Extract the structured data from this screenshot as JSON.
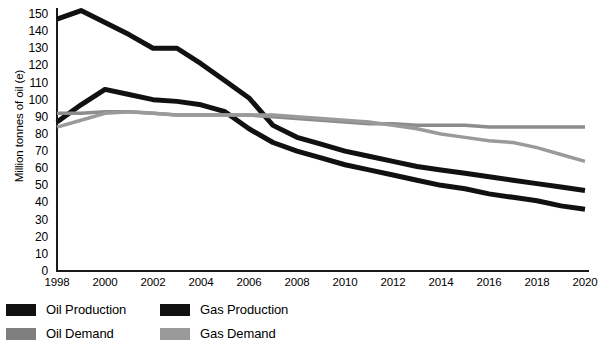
{
  "chart_data": {
    "type": "line",
    "title": "",
    "xlabel": "",
    "ylabel": "Million tonnes of oil (e)",
    "xlim": [
      1998,
      2020
    ],
    "ylim": [
      0,
      150
    ],
    "grid": false,
    "legend_position": "bottom-left",
    "x": [
      1998,
      1999,
      2000,
      2001,
      2002,
      2003,
      2004,
      2005,
      2006,
      2007,
      2008,
      2009,
      2010,
      2011,
      2012,
      2013,
      2014,
      2015,
      2016,
      2017,
      2018,
      2019,
      2020
    ],
    "y_ticks": [
      0,
      10,
      20,
      30,
      40,
      50,
      60,
      70,
      80,
      90,
      100,
      110,
      120,
      130,
      140,
      150
    ],
    "x_ticks": [
      1998,
      2000,
      2002,
      2004,
      2006,
      2008,
      2010,
      2012,
      2014,
      2016,
      2018,
      2020
    ],
    "series": [
      {
        "name": "Oil Production",
        "color": "#111111",
        "width": 5,
        "values": [
          147,
          152,
          145,
          138,
          130,
          130,
          121,
          111,
          101,
          85,
          78,
          74,
          70,
          67,
          64,
          61,
          59,
          57,
          55,
          53,
          51,
          49,
          47
        ]
      },
      {
        "name": "Gas Production",
        "color": "#111111",
        "width": 5,
        "values": [
          87,
          97,
          106,
          103,
          100,
          99,
          97,
          93,
          83,
          75,
          70,
          66,
          62,
          59,
          56,
          53,
          50,
          48,
          45,
          43,
          41,
          38,
          36
        ]
      },
      {
        "name": "Oil Demand",
        "color": "#8c8c8c",
        "width": 3.5,
        "values": [
          92,
          92,
          93,
          93,
          92,
          91,
          91,
          91,
          91,
          90,
          89,
          88,
          87,
          86,
          86,
          85,
          85,
          85,
          84,
          84,
          84,
          84,
          84
        ]
      },
      {
        "name": "Gas Demand",
        "color": "#9a9a9a",
        "width": 3.5,
        "values": [
          84,
          88,
          92,
          93,
          92,
          91,
          91,
          91,
          91,
          91,
          90,
          89,
          88,
          87,
          85,
          83,
          80,
          78,
          76,
          75,
          72,
          68,
          64
        ]
      }
    ]
  },
  "axes": {
    "y_label": "Million tonnes of oil (e)"
  },
  "legend": {
    "items": [
      {
        "label": "Oil Production",
        "color": "#111111"
      },
      {
        "label": "Gas Production",
        "color": "#111111"
      },
      {
        "label": "Oil Demand",
        "color": "#7f7f7f"
      },
      {
        "label": "Gas Demand",
        "color": "#9a9a9a"
      }
    ]
  }
}
